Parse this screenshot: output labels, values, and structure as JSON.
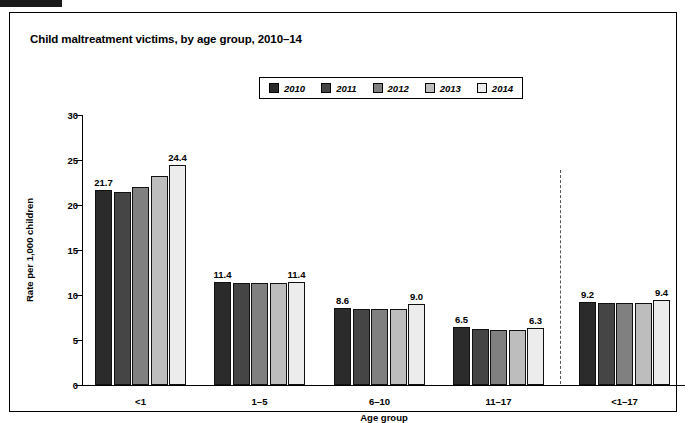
{
  "figure": {
    "title": "Child maltreatment victims, by age group, 2010–14"
  },
  "legend": {
    "position": "top-center",
    "items": [
      {
        "label": "2010",
        "color": "#2b2b2b"
      },
      {
        "label": "2011",
        "color": "#454545"
      },
      {
        "label": "2012",
        "color": "#808080"
      },
      {
        "label": "2013",
        "color": "#bdbdbd"
      },
      {
        "label": "2014",
        "color": "#ececec"
      }
    ]
  },
  "axes": {
    "y_label": "Rate per 1,000 children",
    "x_label": "Age group",
    "y_ticks": [
      "0",
      "5",
      "10",
      "15",
      "20",
      "25",
      "30"
    ]
  },
  "annotations": {
    "divider": "dashed-vertical-separator-before-total"
  },
  "chart_data": {
    "type": "bar",
    "title": "Child maltreatment victims, by age group, 2010–14",
    "xlabel": "Age group",
    "ylabel": "Rate per 1,000 children",
    "ylim": [
      0,
      30
    ],
    "yticks": [
      0,
      5,
      10,
      15,
      20,
      25,
      30
    ],
    "grid": false,
    "legend_position": "top-center",
    "categories": [
      "<1",
      "1–5",
      "6–10",
      "11–17",
      "<1–17"
    ],
    "series": [
      {
        "name": "2010",
        "color": "#2b2b2b",
        "values": [
          21.7,
          11.4,
          8.6,
          6.5,
          9.2
        ]
      },
      {
        "name": "2011",
        "color": "#454545",
        "values": [
          21.4,
          11.3,
          8.4,
          6.2,
          9.1
        ]
      },
      {
        "name": "2012",
        "color": "#808080",
        "values": [
          22.0,
          11.3,
          8.5,
          6.1,
          9.1
        ]
      },
      {
        "name": "2013",
        "color": "#bdbdbd",
        "values": [
          23.2,
          11.3,
          8.5,
          6.1,
          9.1
        ]
      },
      {
        "name": "2014",
        "color": "#ececec",
        "values": [
          24.4,
          11.4,
          9.0,
          6.3,
          9.4
        ]
      }
    ],
    "data_labels": {
      "<1": {
        "2010": "21.7",
        "2014": "24.4"
      },
      "1–5": {
        "2010": "11.4",
        "2014": "11.4"
      },
      "6–10": {
        "2010": "8.6",
        "2014": "9.0"
      },
      "11–17": {
        "2010": "6.5",
        "2014": "6.3"
      },
      "<1–17": {
        "2010": "9.2",
        "2014": "9.4"
      }
    }
  }
}
